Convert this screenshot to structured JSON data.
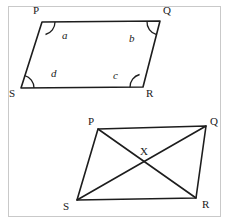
{
  "page": {
    "background_color": "#ffffff",
    "ink_color": "#1d1d1d",
    "border_color": "#c9c9c9",
    "width": 229,
    "height": 223
  },
  "figures": [
    {
      "id": "figure-top",
      "name": "parallelogram-pqrs-angles",
      "description": "Parallelogram P Q R S with four interior angle arcs labelled a, b, c, d",
      "vertices": [
        {
          "name": "P",
          "label": "P",
          "x": 42,
          "y": 22,
          "label_x": 33,
          "label_y": 14
        },
        {
          "name": "Q",
          "label": "Q",
          "x": 160,
          "y": 21,
          "label_x": 163,
          "label_y": 14
        },
        {
          "name": "R",
          "label": "R",
          "x": 143,
          "y": 87,
          "label_x": 146,
          "label_y": 97
        },
        {
          "name": "S",
          "label": "S",
          "x": 21,
          "y": 88,
          "label_x": 9,
          "label_y": 97
        }
      ],
      "edges": [
        {
          "from": "P",
          "to": "Q"
        },
        {
          "from": "Q",
          "to": "R"
        },
        {
          "from": "R",
          "to": "S"
        },
        {
          "from": "S",
          "to": "P"
        }
      ],
      "angle_labels": [
        {
          "label": "a",
          "at_vertex": "P",
          "x": 62,
          "y": 39
        },
        {
          "label": "b",
          "at_vertex": "Q",
          "x": 129,
          "y": 42
        },
        {
          "label": "c",
          "at_vertex": "R",
          "x": 113,
          "y": 79
        },
        {
          "label": "d",
          "at_vertex": "S",
          "x": 51,
          "y": 77
        }
      ],
      "angle_arcs": [
        {
          "at_vertex": "P",
          "radius": 13
        },
        {
          "at_vertex": "Q",
          "radius": 13
        },
        {
          "at_vertex": "R",
          "radius": 13
        },
        {
          "at_vertex": "S",
          "radius": 13
        }
      ]
    },
    {
      "id": "figure-bottom",
      "name": "parallelogram-pqrs-diagonals",
      "description": "Parallelogram P Q R S with diagonals PR and QS meeting at point X",
      "vertices": [
        {
          "name": "P",
          "label": "P",
          "x": 98,
          "y": 129,
          "label_x": 88,
          "label_y": 125
        },
        {
          "name": "Q",
          "label": "Q",
          "x": 206,
          "y": 126,
          "label_x": 210,
          "label_y": 125
        },
        {
          "name": "R",
          "label": "R",
          "x": 196,
          "y": 198,
          "label_x": 202,
          "label_y": 208
        },
        {
          "name": "S",
          "label": "S",
          "x": 77,
          "y": 200,
          "label_x": 63,
          "label_y": 210
        }
      ],
      "edges": [
        {
          "from": "P",
          "to": "Q"
        },
        {
          "from": "Q",
          "to": "R"
        },
        {
          "from": "R",
          "to": "S"
        },
        {
          "from": "S",
          "to": "P"
        }
      ],
      "diagonals": [
        {
          "from": "P",
          "to": "R"
        },
        {
          "from": "Q",
          "to": "S"
        }
      ],
      "intersection": {
        "name": "X",
        "label": "X",
        "x": 144,
        "y": 163,
        "label_x": 140,
        "label_y": 155
      }
    }
  ]
}
